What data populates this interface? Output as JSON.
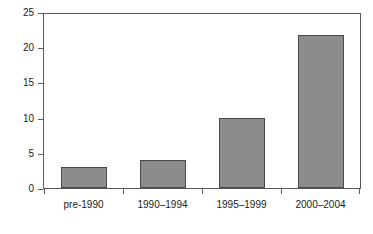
{
  "chart_data": {
    "type": "bar",
    "title": "",
    "subtitle": "",
    "xlabel": "",
    "ylabel": "",
    "categories": [
      "pre-1990",
      "1990–1994",
      "1995–1999",
      "2000–2004"
    ],
    "values": [
      3,
      4,
      10,
      22
    ],
    "ylim": [
      0,
      25
    ],
    "yticks": [
      0,
      5,
      10,
      15,
      20,
      25
    ],
    "ytick_labels": [
      "0",
      "5",
      "10",
      "15",
      "20",
      "25"
    ],
    "grid": false,
    "legend": null,
    "legend_position": "none",
    "bars": [
      {
        "category": "pre-1990",
        "value": 3
      },
      {
        "category": "1990–1994",
        "value": 4
      },
      {
        "category": "1995–1999",
        "value": 10
      },
      {
        "category": "2000–2004",
        "value": 22
      }
    ],
    "colors": {
      "bar_fill": "#8c8c8c",
      "bar_border": "#4a4a4a",
      "axis": "#5a5a5a",
      "text": "#1a1a1a",
      "background": "#ffffff"
    }
  }
}
